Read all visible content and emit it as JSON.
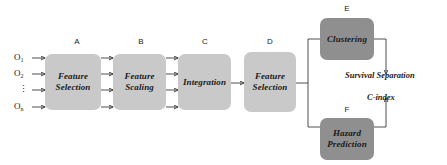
{
  "diagram": {
    "colors": {
      "box_light": "#c9c9c9",
      "box_dark": "#8f8f8f",
      "connector": "#3a3a3a",
      "background": "#ffffff",
      "text": "#1a1a1a"
    },
    "inputs": [
      {
        "id": "o1",
        "base": "O",
        "sub": "1"
      },
      {
        "id": "o2",
        "base": "O",
        "sub": "2"
      },
      {
        "id": "odots",
        "base": "⋮",
        "sub": ""
      },
      {
        "id": "on",
        "base": "O",
        "sub": "n"
      }
    ],
    "nodes": [
      {
        "key": "A",
        "tag": "A",
        "line1": "Feature",
        "line2": "Selection",
        "shade": "light"
      },
      {
        "key": "B",
        "tag": "B",
        "line1": "Feature",
        "line2": "Scaling",
        "shade": "light"
      },
      {
        "key": "C",
        "tag": "C",
        "line1": "Integration",
        "line2": "",
        "shade": "light"
      },
      {
        "key": "D",
        "tag": "D",
        "line1": "Feature",
        "line2": "Selection",
        "shade": "light"
      },
      {
        "key": "E",
        "tag": "E",
        "line1": "Clustering",
        "line2": "",
        "shade": "dark"
      },
      {
        "key": "F",
        "tag": "F",
        "line1": "Hazard",
        "line2": "Prediction",
        "shade": "dark"
      }
    ],
    "metrics": [
      {
        "key": "survival_separation",
        "label": "Survival Separation"
      },
      {
        "key": "c_index",
        "label": "C-index"
      }
    ]
  }
}
